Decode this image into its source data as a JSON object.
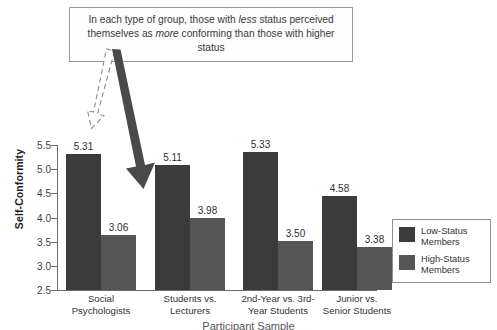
{
  "caption": {
    "prefix": "In each type of group, those with ",
    "em1": "less",
    "middle": " status perceived themselves as ",
    "em2": "more",
    "suffix": " conforming than those with higher status"
  },
  "annotations": {
    "dashed_arrow_name": "dashed-arrow-pointing-to-low-status-bar",
    "solid_arrow_name": "solid-arrow-pointing-to-high-status-bar"
  },
  "legend": {
    "items": [
      {
        "label": "Low-Status Members",
        "color": "#3b3b3b"
      },
      {
        "label": "High-Status Members",
        "color": "#565656"
      }
    ]
  },
  "axis_title_bottom": "Participant Sample",
  "chart_data": {
    "type": "bar",
    "title": "",
    "xlabel": "",
    "ylabel": "Self-Conformity",
    "ylim": [
      2.5,
      5.5
    ],
    "yticks": [
      "2.5",
      "3.0",
      "3.5",
      "4.0",
      "4.5",
      "5.0",
      "5.5"
    ],
    "grid": false,
    "legend_position": "right",
    "categories": [
      "Social Psychologists",
      "Students vs. Lecturers",
      "2nd-Year vs. 3rd-Year Students",
      "Junior vs. Senior Students"
    ],
    "category_lines": [
      [
        "Social",
        "Psychologists"
      ],
      [
        "Students vs.",
        "Lecturers"
      ],
      [
        "2nd-Year vs. 3rd-",
        "Year Students"
      ],
      [
        "Junior vs.",
        "Senior Students"
      ]
    ],
    "series": [
      {
        "name": "Low-Status Members",
        "color": "#3b3b3b",
        "values": [
          5.31,
          5.11,
          5.33,
          4.58
        ],
        "labels": [
          "5.31",
          "5.11",
          "5.33",
          "4.58"
        ],
        "drawn_values": [
          5.31,
          5.09,
          5.35,
          4.44
        ]
      },
      {
        "name": "High-Status Members",
        "color": "#565656",
        "values": [
          3.06,
          3.98,
          3.5,
          3.38
        ],
        "labels": [
          "3.06",
          "3.98",
          "3.50",
          "3.38"
        ],
        "drawn_values": [
          3.63,
          3.98,
          3.52,
          3.38
        ]
      }
    ]
  }
}
